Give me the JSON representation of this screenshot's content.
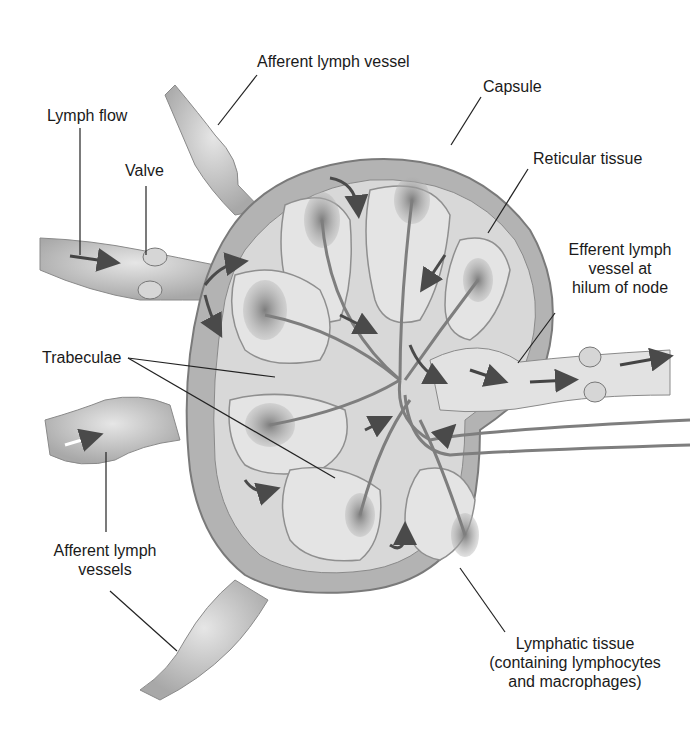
{
  "diagram": {
    "labels": {
      "afferent_top": "Afferent lymph vessel",
      "capsule": "Capsule",
      "lymph_flow": "Lymph flow",
      "valve": "Valve",
      "reticular": "Reticular tissue",
      "efferent_1": "Efferent lymph",
      "efferent_2": "vessel at",
      "efferent_3": "hilum of node",
      "trabeculae": "Trabeculae",
      "afferent_left_1": "Afferent lymph",
      "afferent_left_2": "vessels",
      "lymphatic_1": "Lymphatic tissue",
      "lymphatic_2": "(containing lymphocytes",
      "lymphatic_3": "and macrophages)"
    },
    "colors": {
      "capsule_outer": "#a9a9a9",
      "capsule_inner": "#cfcfcf",
      "tissue": "#dcdcdc",
      "nodule": "#8a8a8a",
      "vessel": "#bdbdbd",
      "arrow": "#4a4a4a",
      "leader": "#222222"
    }
  }
}
